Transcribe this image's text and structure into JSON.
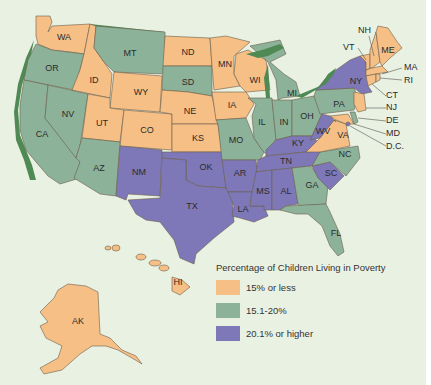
{
  "map": {
    "title": "Percentage of Children Living in Poverty",
    "colors": {
      "low": "#f5bf86",
      "mid": "#8db29a",
      "high": "#7e78b8",
      "shore": "#4f8a55",
      "shore_orange": "#e8a13a",
      "background": "#e9f1e2"
    },
    "legend": [
      {
        "label": "15% or less",
        "category": "low",
        "color": "#f5bf86"
      },
      {
        "label": "15.1-20%",
        "category": "mid",
        "color": "#8db29a"
      },
      {
        "label": "20.1% or higher",
        "category": "high",
        "color": "#7e78b8"
      }
    ],
    "states": {
      "WA": {
        "label": "WA",
        "category": "low"
      },
      "OR": {
        "label": "OR",
        "category": "mid"
      },
      "CA": {
        "label": "CA",
        "category": "mid"
      },
      "ID": {
        "label": "ID",
        "category": "low"
      },
      "NV": {
        "label": "NV",
        "category": "mid"
      },
      "MT": {
        "label": "MT",
        "category": "mid"
      },
      "WY": {
        "label": "WY",
        "category": "low"
      },
      "UT": {
        "label": "UT",
        "category": "low"
      },
      "CO": {
        "label": "CO",
        "category": "low"
      },
      "AZ": {
        "label": "AZ",
        "category": "mid"
      },
      "NM": {
        "label": "NM",
        "category": "high"
      },
      "ND": {
        "label": "ND",
        "category": "low"
      },
      "SD": {
        "label": "SD",
        "category": "mid"
      },
      "NE": {
        "label": "NE",
        "category": "low"
      },
      "KS": {
        "label": "KS",
        "category": "low"
      },
      "OK": {
        "label": "OK",
        "category": "high"
      },
      "TX": {
        "label": "TX",
        "category": "high"
      },
      "MN": {
        "label": "MN",
        "category": "low"
      },
      "IA": {
        "label": "IA",
        "category": "low"
      },
      "MO": {
        "label": "MO",
        "category": "mid"
      },
      "AR": {
        "label": "AR",
        "category": "high"
      },
      "LA": {
        "label": "LA",
        "category": "high"
      },
      "WI": {
        "label": "WI",
        "category": "low"
      },
      "IL": {
        "label": "IL",
        "category": "mid"
      },
      "MI": {
        "label": "MI",
        "category": "mid"
      },
      "IN": {
        "label": "IN",
        "category": "mid"
      },
      "OH": {
        "label": "OH",
        "category": "mid"
      },
      "KY": {
        "label": "KY",
        "category": "high"
      },
      "TN": {
        "label": "TN",
        "category": "high"
      },
      "MS": {
        "label": "MS",
        "category": "high"
      },
      "AL": {
        "label": "AL",
        "category": "high"
      },
      "GA": {
        "label": "GA",
        "category": "mid"
      },
      "FL": {
        "label": "FL",
        "category": "mid"
      },
      "SC": {
        "label": "SC",
        "category": "high"
      },
      "NC": {
        "label": "NC",
        "category": "mid"
      },
      "VA": {
        "label": "VA",
        "category": "low"
      },
      "WV": {
        "label": "WV",
        "category": "high"
      },
      "PA": {
        "label": "PA",
        "category": "mid"
      },
      "NY": {
        "label": "NY",
        "category": "high"
      },
      "VT": {
        "label": "VT",
        "category": "low"
      },
      "NH": {
        "label": "NH",
        "category": "low"
      },
      "ME": {
        "label": "ME",
        "category": "low"
      },
      "MA": {
        "label": "MA",
        "category": "low"
      },
      "RI": {
        "label": "RI",
        "category": "low"
      },
      "CT": {
        "label": "CT",
        "category": "low"
      },
      "NJ": {
        "label": "NJ",
        "category": "low"
      },
      "DE": {
        "label": "DE",
        "category": "mid"
      },
      "MD": {
        "label": "MD",
        "category": "low"
      },
      "DC": {
        "label": "D.C.",
        "category": "high"
      },
      "AK": {
        "label": "AK",
        "category": "low"
      },
      "HI": {
        "label": "HI",
        "category": "low"
      }
    }
  }
}
